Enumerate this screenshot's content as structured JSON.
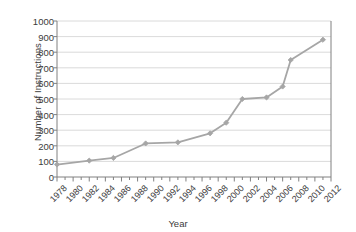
{
  "chart_data": {
    "type": "line",
    "title": "",
    "xlabel": "Year",
    "ylabel": "Number of Instructions",
    "xlim": [
      1978,
      2012
    ],
    "ylim": [
      0,
      1000
    ],
    "grid": "horizontal",
    "legend": "none",
    "marker": "diamond",
    "series_color": "#a6a6a6",
    "axis_color": "#808080",
    "grid_color": "#d0d0d0",
    "text_color": "#3b3b3b",
    "x_tick_labels": [
      "1978",
      "1980",
      "1982",
      "1984",
      "1986",
      "1988",
      "1990",
      "1992",
      "1994",
      "1996",
      "1998",
      "2000",
      "2002",
      "2004",
      "2006",
      "2008",
      "2010",
      "2012"
    ],
    "x_tick_step": 2,
    "x_minor_tick_step": 1,
    "y_tick_labels": [
      "0",
      "100",
      "200",
      "300",
      "400",
      "500",
      "600",
      "700",
      "800",
      "900",
      "1000"
    ],
    "y_tick_step": 100,
    "x": [
      1978,
      1982,
      1985,
      1989,
      1993,
      1997,
      1999,
      2001,
      2004,
      2006,
      2007,
      2011
    ],
    "values": [
      80,
      105,
      122,
      215,
      222,
      280,
      348,
      500,
      510,
      580,
      750,
      880
    ],
    "points": [
      {
        "x": 1978,
        "y": 80
      },
      {
        "x": 1982,
        "y": 105
      },
      {
        "x": 1985,
        "y": 122
      },
      {
        "x": 1989,
        "y": 215
      },
      {
        "x": 1993,
        "y": 222
      },
      {
        "x": 1997,
        "y": 280
      },
      {
        "x": 1999,
        "y": 348
      },
      {
        "x": 2001,
        "y": 500
      },
      {
        "x": 2004,
        "y": 510
      },
      {
        "x": 2006,
        "y": 580
      },
      {
        "x": 2007,
        "y": 750
      },
      {
        "x": 2011,
        "y": 880
      }
    ]
  }
}
